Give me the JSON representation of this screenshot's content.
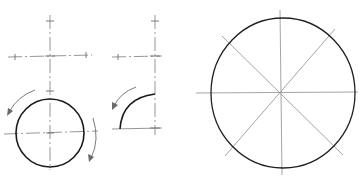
{
  "figure": {
    "panels": [
      {
        "id": "step-1",
        "label": "crosshair axes with tick marks"
      },
      {
        "id": "step-2",
        "label": "circle drawn in two strokes with direction arrows"
      },
      {
        "id": "step-3",
        "label": "quarter arc stroke with direction arrow"
      },
      {
        "id": "step-4",
        "label": "large circle with vertical, horizontal and diagonal guide lines"
      }
    ],
    "colors": {
      "stroke": "#1a1a1a",
      "guide": "#8a8a8a",
      "background": "#ffffff"
    }
  }
}
